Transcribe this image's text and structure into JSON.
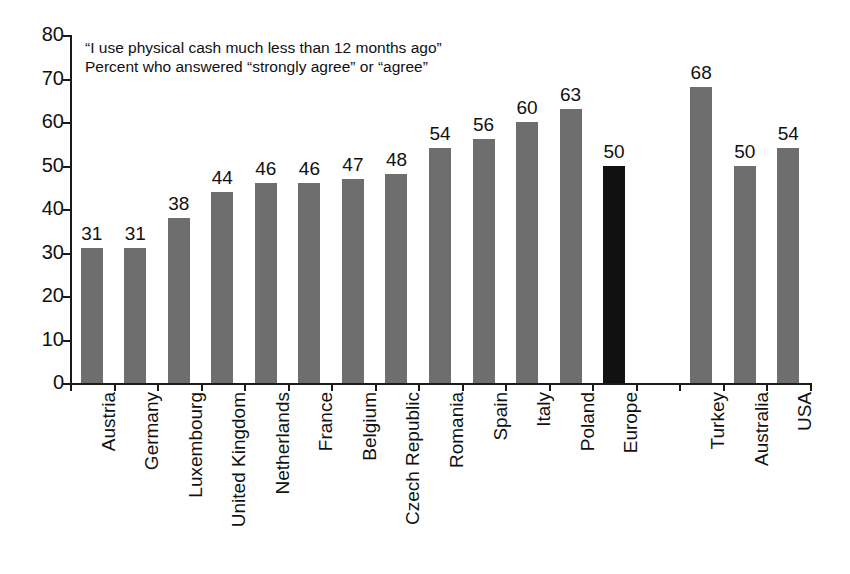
{
  "chart_data": {
    "type": "bar",
    "title": "",
    "subtitle": "",
    "xlabel": "",
    "ylabel": "",
    "ylim": [
      0,
      80
    ],
    "ytick_step": 10,
    "yticks": [
      0,
      10,
      20,
      30,
      40,
      50,
      60,
      70,
      80
    ],
    "grid": false,
    "legend": false,
    "categories": [
      "Austria",
      "Germany",
      "Luxembourg",
      "United Kingdom",
      "Netherlands",
      "France",
      "Belgium",
      "Czech Republic",
      "Romania",
      "Spain",
      "Italy",
      "Poland",
      "Europe",
      "",
      "Turkey",
      "Australia",
      "USA"
    ],
    "values": [
      31,
      31,
      38,
      44,
      46,
      46,
      47,
      48,
      54,
      56,
      60,
      63,
      50,
      null,
      68,
      50,
      54
    ],
    "value_labels": [
      "31",
      "31",
      "38",
      "44",
      "46",
      "46",
      "47",
      "48",
      "54",
      "56",
      "60",
      "63",
      "50",
      "",
      "68",
      "50",
      "54"
    ],
    "highlight_index": 12,
    "annotations": [
      "“I use physical cash much less than 12 months ago”",
      "Percent who answered “strongly agree” or “agree”"
    ],
    "colors": {
      "bar": "#6e6e6e",
      "bar_highlight": "#111111",
      "axis": "#1a1a1a",
      "text": "#111111",
      "background": "#ffffff"
    }
  }
}
